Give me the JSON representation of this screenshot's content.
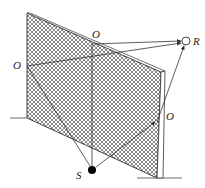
{
  "diagram": {
    "type": "reflection-paths-through-wall",
    "labels": {
      "source": "S",
      "receiver": "R",
      "reflection_top": "O",
      "reflection_left": "O",
      "reflection_right": "O"
    },
    "colors": {
      "line": "#333333",
      "hatch": "#555555",
      "source_fill": "#000000",
      "receiver_fill": "#ffffff"
    }
  }
}
